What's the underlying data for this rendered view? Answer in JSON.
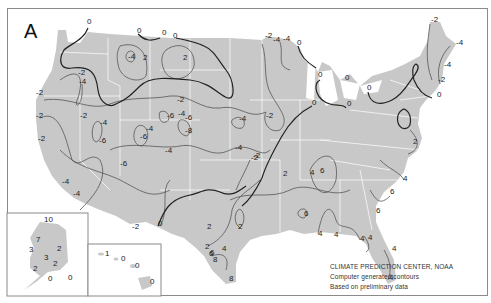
{
  "panel_label": "A",
  "credits": {
    "line1": "CLIMATE PREDICTION CENTER, NOAA",
    "line2": "Computer generated contours",
    "line3": "Based on preliminary data"
  },
  "colors": {
    "land": "#c8c8c8",
    "state_borders": "#ffffff",
    "contour": "#555555",
    "zero_contour": "#222222",
    "frame": "#8a8a8a"
  },
  "contour_labels_conus": [
    {
      "v": "0",
      "x": 87,
      "y": 24
    },
    {
      "v": "0",
      "x": 137,
      "y": 33
    },
    {
      "v": "0",
      "x": 162,
      "y": 35
    },
    {
      "v": "0",
      "x": 173,
      "y": 38
    },
    {
      "v": "-4",
      "x": 128,
      "y": 59
    },
    {
      "v": "2",
      "x": 143,
      "y": 60
    },
    {
      "v": "2",
      "x": 183,
      "y": 60
    },
    {
      "v": "-2",
      "x": 78,
      "y": 75
    },
    {
      "v": "-4",
      "x": 79,
      "y": 84
    },
    {
      "v": "-2",
      "x": 36,
      "y": 95
    },
    {
      "v": "-2",
      "x": 36,
      "y": 118
    },
    {
      "v": "-2",
      "x": 80,
      "y": 118
    },
    {
      "v": "-4",
      "x": 100,
      "y": 125
    },
    {
      "v": "-6",
      "x": 99,
      "y": 143
    },
    {
      "v": "-2",
      "x": 38,
      "y": 141
    },
    {
      "v": "-2",
      "x": 177,
      "y": 102
    },
    {
      "v": "-6",
      "x": 167,
      "y": 118
    },
    {
      "v": "-4",
      "x": 178,
      "y": 116
    },
    {
      "v": "-6",
      "x": 185,
      "y": 120
    },
    {
      "v": "-4",
      "x": 146,
      "y": 131
    },
    {
      "v": "-8",
      "x": 185,
      "y": 133
    },
    {
      "v": "-6",
      "x": 140,
      "y": 139
    },
    {
      "v": "-6",
      "x": 120,
      "y": 166
    },
    {
      "v": "-4",
      "x": 165,
      "y": 153
    },
    {
      "v": "-4",
      "x": 239,
      "y": 121
    },
    {
      "v": "-4",
      "x": 235,
      "y": 150
    },
    {
      "v": "-2",
      "x": 266,
      "y": 118
    },
    {
      "v": "-2",
      "x": 253,
      "y": 158
    },
    {
      "v": "-4",
      "x": 62,
      "y": 184
    },
    {
      "v": "-4",
      "x": 73,
      "y": 196
    },
    {
      "v": "-2",
      "x": 132,
      "y": 229
    },
    {
      "v": "0",
      "x": 158,
      "y": 226
    },
    {
      "v": "-2",
      "x": 265,
      "y": 38
    },
    {
      "v": "-4",
      "x": 273,
      "y": 42
    },
    {
      "v": "-4",
      "x": 283,
      "y": 41
    },
    {
      "v": "0",
      "x": 297,
      "y": 45
    },
    {
      "v": "0",
      "x": 318,
      "y": 77
    },
    {
      "v": "0",
      "x": 345,
      "y": 80
    },
    {
      "v": "0",
      "x": 312,
      "y": 105
    },
    {
      "v": "0",
      "x": 347,
      "y": 106
    },
    {
      "v": "0",
      "x": 367,
      "y": 90
    },
    {
      "v": "-2",
      "x": 431,
      "y": 22
    },
    {
      "v": "-4",
      "x": 456,
      "y": 45
    },
    {
      "v": "-4",
      "x": 444,
      "y": 67
    },
    {
      "v": "-2",
      "x": 438,
      "y": 82
    },
    {
      "v": "0",
      "x": 437,
      "y": 97
    },
    {
      "v": "2",
      "x": 413,
      "y": 144
    },
    {
      "v": "-2",
      "x": 251,
      "y": 160
    },
    {
      "v": "2",
      "x": 283,
      "y": 176
    },
    {
      "v": "4",
      "x": 310,
      "y": 175
    },
    {
      "v": "6",
      "x": 320,
      "y": 173
    },
    {
      "v": "4",
      "x": 403,
      "y": 181
    },
    {
      "v": "6",
      "x": 390,
      "y": 194
    },
    {
      "v": "6",
      "x": 376,
      "y": 213
    },
    {
      "v": "6",
      "x": 304,
      "y": 216
    },
    {
      "v": "2",
      "x": 238,
      "y": 229
    },
    {
      "v": "2",
      "x": 207,
      "y": 229
    },
    {
      "v": "6",
      "x": 210,
      "y": 255
    },
    {
      "v": "4",
      "x": 222,
      "y": 251
    },
    {
      "v": "2",
      "x": 205,
      "y": 249
    },
    {
      "v": "6",
      "x": 209,
      "y": 256
    },
    {
      "v": "8",
      "x": 213,
      "y": 262
    },
    {
      "v": "8",
      "x": 229,
      "y": 281
    },
    {
      "v": "4",
      "x": 318,
      "y": 236
    },
    {
      "v": "4",
      "x": 334,
      "y": 237
    },
    {
      "v": "4",
      "x": 360,
      "y": 241
    },
    {
      "v": "4",
      "x": 368,
      "y": 240
    },
    {
      "v": "4",
      "x": 392,
      "y": 251
    },
    {
      "v": "4",
      "x": 389,
      "y": 280
    }
  ],
  "contour_labels_alaska": [
    {
      "v": "10",
      "x": 44,
      "y": 82
    },
    {
      "v": "7",
      "x": 36,
      "y": 102
    },
    {
      "v": "3",
      "x": 29,
      "y": 112
    },
    {
      "v": "2",
      "x": 57,
      "y": 111
    },
    {
      "v": "3",
      "x": 44,
      "y": 120
    },
    {
      "v": "2",
      "x": 53,
      "y": 126
    },
    {
      "v": "2",
      "x": 33,
      "y": 131
    },
    {
      "v": "0",
      "x": 48,
      "y": 141
    },
    {
      "v": "0",
      "x": 68,
      "y": 140
    }
  ],
  "contour_labels_hawaii": [
    {
      "v": "1",
      "x": 105,
      "y": 116
    },
    {
      "v": "0",
      "x": 121,
      "y": 121
    },
    {
      "v": "0",
      "x": 135,
      "y": 128
    },
    {
      "v": "0",
      "x": 150,
      "y": 144
    }
  ],
  "insets": {
    "alaska": {
      "label": "Alaska"
    },
    "hawaii": {
      "label": "Hawaii"
    }
  }
}
